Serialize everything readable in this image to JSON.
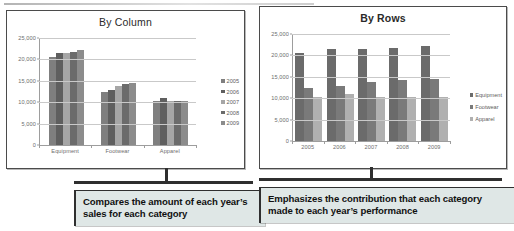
{
  "figure": {
    "callouts": [
      {
        "id": "callout-left",
        "text": "Compares the amount of each year’s sales for each category"
      },
      {
        "id": "callout-right",
        "text": "Emphasizes the contribution that each category made to each year’s performance"
      }
    ]
  },
  "colors": {
    "series_2005": "#7f7f7f",
    "series_2006": "#5f5f5f",
    "series_2007": "#a6a6a6",
    "series_2008": "#6b6b6b",
    "series_2009": "#8c8c8c",
    "equipment": "#6b6b6b",
    "footwear": "#7a7a7a",
    "apparel": "#b0b0b0",
    "grid": "#c9c9c9",
    "axis": "#9d9d9d",
    "panel_border": "#4b4b4b",
    "callout_bg": "#dfe7e6",
    "callout_accent": "#2f2f2f"
  },
  "chart_data": [
    {
      "id": "by-column",
      "type": "bar",
      "title": "By Column",
      "xlabel": "",
      "ylabel": "",
      "ylim": [
        0,
        25000
      ],
      "yticks": [
        "0",
        "5,000",
        "10,000",
        "15,000",
        "20,000",
        "25,000"
      ],
      "ytick_values": [
        0,
        5000,
        10000,
        15000,
        20000,
        25000
      ],
      "grid": true,
      "legend_position": "right",
      "categories": [
        "Equipment",
        "Footwear",
        "Apparel"
      ],
      "series": [
        {
          "name": "2005",
          "values": [
            20500,
            12500,
            10300
          ]
        },
        {
          "name": "2006",
          "values": [
            21600,
            12900,
            11000
          ]
        },
        {
          "name": "2007",
          "values": [
            21500,
            13800,
            10400
          ]
        },
        {
          "name": "2008",
          "values": [
            21700,
            14200,
            10200
          ]
        },
        {
          "name": "2009",
          "values": [
            22300,
            14500,
            10300
          ]
        }
      ]
    },
    {
      "id": "by-rows",
      "type": "bar",
      "title": "By Rows",
      "xlabel": "",
      "ylabel": "",
      "ylim": [
        0,
        25000
      ],
      "yticks": [
        "0",
        "5,000",
        "10,000",
        "15,000",
        "20,000",
        "25,000"
      ],
      "ytick_values": [
        0,
        5000,
        10000,
        15000,
        20000,
        25000
      ],
      "grid": true,
      "legend_position": "right",
      "categories": [
        "2005",
        "2006",
        "2007",
        "2008",
        "2009"
      ],
      "series": [
        {
          "name": "Equipment",
          "values": [
            20500,
            21600,
            21500,
            21700,
            22300
          ]
        },
        {
          "name": "Footwear",
          "values": [
            12500,
            12900,
            13800,
            14200,
            14500
          ]
        },
        {
          "name": "Apparel",
          "values": [
            10300,
            11000,
            10400,
            10200,
            10300
          ]
        }
      ]
    }
  ]
}
